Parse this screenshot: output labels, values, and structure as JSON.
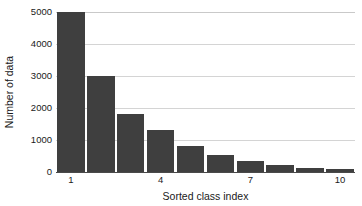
{
  "chart_data": {
    "type": "bar",
    "title": "",
    "subtitle": "",
    "xlabel": "Sorted class index",
    "ylabel": "Number of data",
    "categories": [
      1,
      2,
      3,
      4,
      5,
      6,
      7,
      8,
      9,
      10
    ],
    "values": [
      5000,
      3000,
      1800,
      1320,
      820,
      530,
      330,
      220,
      140,
      80
    ],
    "series": [
      {
        "name": "Number of data",
        "values": [
          5000,
          3000,
          1800,
          1320,
          820,
          530,
          330,
          220,
          140,
          80
        ],
        "color": "#3f3f3f"
      }
    ],
    "xlim": [
      0.5,
      10.5
    ],
    "ylim": [
      0,
      5000
    ],
    "ytick_values": [
      0,
      1000,
      2000,
      3000,
      4000,
      5000
    ],
    "ytick_labels": [
      "0",
      "1000",
      "2000",
      "3000",
      "4000",
      "5000"
    ],
    "xtick_values": [
      1,
      4,
      7,
      10
    ],
    "xtick_labels": [
      "1",
      "4",
      "7",
      "10"
    ],
    "grid": "horizontal",
    "grid_color": "#d4d4d4",
    "legend": "none",
    "legend_position": "",
    "annotations": [],
    "background_color": "#ffffff",
    "axis_color": "#4a4a4a",
    "bar_color": "#3f3f3f"
  }
}
